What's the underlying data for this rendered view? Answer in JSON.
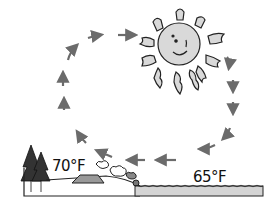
{
  "diagram": {
    "type": "convection-cycle illustration (sea breeze)",
    "labels": {
      "land_temperature": "70°F",
      "water_temperature": "65°F"
    },
    "elements": [
      "sun-with-face",
      "circular-arrow-cycle",
      "trees",
      "tent",
      "shrubs",
      "land",
      "water"
    ],
    "colors": {
      "arrow": "#6b6b6b",
      "sun_fill": "#d9d9d9",
      "outline": "#222222",
      "water_fill": "#d4d4d4"
    }
  }
}
